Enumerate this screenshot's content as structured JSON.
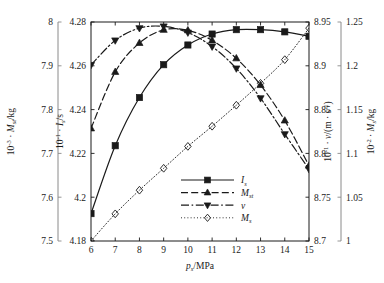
{
  "chart_data": {
    "type": "line",
    "title": "",
    "xlabel": "p_s/MPa",
    "xlabel_parts": {
      "main": "p",
      "sub": "s",
      "unit": "/MPa"
    },
    "xlim": [
      6,
      15
    ],
    "xticks": [
      6,
      7,
      8,
      9,
      10,
      11,
      12,
      13,
      14,
      15
    ],
    "xticklabels": [
      "6",
      "7",
      "8",
      "9",
      "10",
      "11",
      "12",
      "13",
      "14",
      "15"
    ],
    "grid": false,
    "legend_position": "lower-center-right",
    "axes": [
      {
        "id": "axis-mst-outer-left",
        "side": "left",
        "order": 1,
        "label": "10^-3 · M_st/kg",
        "label_parts": {
          "factor": "10",
          "exp": "-3",
          "dot": "·",
          "sym": "M",
          "sub": "st",
          "unit": "/kg"
        },
        "lim": [
          7.5,
          8.0
        ],
        "ticks": [
          7.5,
          7.6,
          7.7,
          7.8,
          7.9,
          8.0
        ],
        "ticklabels": [
          "7.5",
          "7.6",
          "7.7",
          "7.8",
          "7.9",
          "8"
        ],
        "color": "#8a8a8a"
      },
      {
        "id": "axis-is-inner-left",
        "side": "left",
        "order": 2,
        "label": "10^-1 · I_s/s",
        "label_parts": {
          "factor": "10",
          "exp": "-1",
          "dot": "·",
          "sym": "I",
          "sub": "s",
          "unit": "/s"
        },
        "lim": [
          4.18,
          4.28
        ],
        "ticks": [
          4.18,
          4.2,
          4.22,
          4.24,
          4.26,
          4.28
        ],
        "ticklabels": [
          "4.18",
          "4.2",
          "4.22",
          "4.24",
          "4.26",
          "4.28"
        ],
        "color": "#1a1a1a"
      },
      {
        "id": "axis-v-inner-right",
        "side": "right",
        "order": 1,
        "label": "10^-1 · v/(m · s^-1)",
        "label_parts": {
          "factor": "10",
          "exp": "-1",
          "dot": "·",
          "sym": "v",
          "unit": "/(m · s",
          "unitexp": "-1",
          "unitclose": ")"
        },
        "lim": [
          8.7,
          8.95
        ],
        "ticks": [
          8.7,
          8.75,
          8.8,
          8.85,
          8.9,
          8.95
        ],
        "ticklabels": [
          "8.7",
          "8.75",
          "8.8",
          "8.85",
          "8.9",
          "8.95"
        ],
        "color": "#1a1a1a"
      },
      {
        "id": "axis-ms-outer-right",
        "side": "right",
        "order": 2,
        "label": "10^-2 · M_s/kg",
        "label_parts": {
          "factor": "10",
          "exp": "-2",
          "dot": "·",
          "sym": "M",
          "sub": "s",
          "unit": "/kg"
        },
        "lim": [
          1.0,
          1.25
        ],
        "ticks": [
          1.0,
          1.05,
          1.1,
          1.15,
          1.2,
          1.25
        ],
        "ticklabels": [
          "1",
          "1.05",
          "1.1",
          "1.15",
          "1.2",
          "1.25"
        ],
        "color": "#8a8a8a"
      }
    ],
    "x": [
      6,
      7,
      8,
      9,
      10,
      11,
      12,
      13,
      14,
      15
    ],
    "series": [
      {
        "name": "I_s",
        "legend_label": "I_s",
        "legend_parts": {
          "sym": "I",
          "sub": "s"
        },
        "axis": "axis-is-inner-left",
        "marker": "square",
        "linestyle": "solid",
        "color": "#1a1a1a",
        "values": [
          4.1925,
          4.2235,
          4.2455,
          4.2605,
          4.2695,
          4.2745,
          4.2765,
          4.2765,
          4.2755,
          4.2735
        ]
      },
      {
        "name": "M_st",
        "legend_label": "M_st",
        "legend_parts": {
          "sym": "M",
          "sub": "st"
        },
        "axis": "axis-mst-outer-left",
        "marker": "triangle-up",
        "linestyle": "dashed",
        "color": "#1a1a1a",
        "values": [
          7.757,
          7.886,
          7.952,
          7.982,
          7.981,
          7.958,
          7.917,
          7.856,
          7.775,
          7.672
        ]
      },
      {
        "name": "v",
        "legend_label": "v",
        "legend_parts": {
          "sym": "v",
          "sub": ""
        },
        "axis": "axis-v-inner-right",
        "marker": "triangle-down",
        "linestyle": "dashdot",
        "color": "#1a1a1a",
        "values": [
          8.901,
          8.929,
          8.943,
          8.945,
          8.938,
          8.922,
          8.897,
          8.863,
          8.822,
          8.782
        ]
      },
      {
        "name": "M_s",
        "legend_label": "M_s",
        "legend_parts": {
          "sym": "M",
          "sub": "s"
        },
        "axis": "axis-ms-outer-right",
        "marker": "diamond",
        "linestyle": "dotted",
        "color": "#1a1a1a",
        "values": [
          1.0,
          1.031,
          1.058,
          1.083,
          1.108,
          1.131,
          1.155,
          1.18,
          1.207,
          1.243
        ]
      }
    ]
  }
}
